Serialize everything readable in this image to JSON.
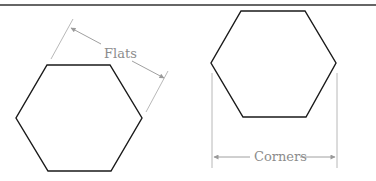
{
  "diagram": {
    "left": {
      "shape": "hexagon",
      "orientation": "flat-top",
      "dimension_label": "Flats",
      "dimension_type": "across-flats"
    },
    "right": {
      "shape": "hexagon",
      "orientation": "flat-top",
      "dimension_label": "Corners",
      "dimension_type": "across-corners"
    },
    "colors": {
      "shape_stroke": "#1a1a1a",
      "dimension": "#a8a8a8",
      "label": "#8c8c8c",
      "rule": "#333333"
    }
  }
}
